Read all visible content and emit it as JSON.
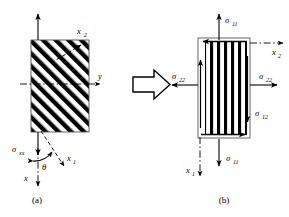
{
  "figure": {
    "caption_a": "(a)",
    "caption_b": "(b)",
    "transform_arrow": "implies-arrow"
  },
  "panel_a": {
    "name": "off-axis-lamina-global-coordinates",
    "block": {
      "name": "hatched-lamina-block",
      "hatch_angle_deg": 45,
      "fill": "#ffffff",
      "stroke": "#000000"
    },
    "labels": {
      "sigma_xx": "σ",
      "sigma_xx_sub": "xx",
      "axis_x2": "x",
      "axis_x2_sub": "2",
      "axis_y": "y",
      "axis_x1": "x",
      "axis_x1_sub": "1",
      "axis_x": "x",
      "angle_theta": "θ"
    }
  },
  "panel_b": {
    "name": "on-axis-lamina-material-coordinates",
    "block": {
      "name": "striped-lamina-block",
      "stripe_orientation": "vertical",
      "fill": "#ffffff",
      "stroke": "#000000"
    },
    "labels": {
      "sigma_11_top": "σ",
      "sigma_11_top_sub": "11",
      "sigma_11_bottom": "σ",
      "sigma_11_bottom_sub": "11",
      "sigma_22_left": "σ",
      "sigma_22_left_sub": "22",
      "sigma_22_right": "σ",
      "sigma_22_right_sub": "22",
      "sigma_12": "σ",
      "sigma_12_sub": "12",
      "axis_x2": "x",
      "axis_x2_sub": "2",
      "axis_x1": "x",
      "axis_x1_sub": "1"
    }
  },
  "colors": {
    "stroke": "#000000",
    "background": "#ffffff"
  }
}
